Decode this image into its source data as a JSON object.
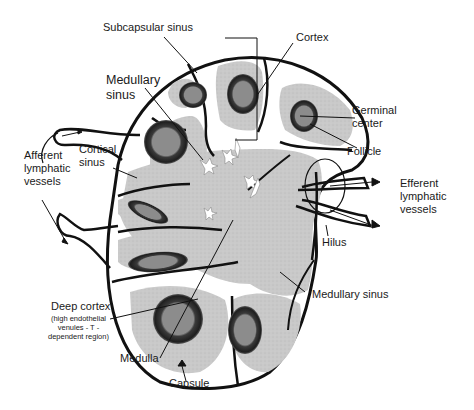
{
  "diagram": {
    "colors": {
      "background": "#ffffff",
      "outline": "#111111",
      "parenchyma": "#c8c8c8",
      "sinus": "#ffffff",
      "follicle_rim": "#2a2a2a",
      "germinal_center": "#8a8a8a"
    },
    "labels": {
      "subcapsular_sinus": "Subcapsular sinus",
      "cortex": "Cortex",
      "medullary_sinus_top": "Medullary\nsinus",
      "germinal_center": "Germinal\ncenter",
      "follicle": "Follicle",
      "afferent": "Afferent\nlymphatic\nvessels",
      "cortical_sinus": "Cortical\nsinus",
      "efferent": "Efferent\nlymphatic\nvessels",
      "hilus": "Hilus",
      "medullary_sinus_bottom": "Medullary sinus",
      "deep_cortex": "Deep cortex",
      "deep_cortex_note": "(high endothelial\nvenules - T -\ndependent region)",
      "medulla": "Medulla",
      "capsule": "Capsule"
    }
  }
}
